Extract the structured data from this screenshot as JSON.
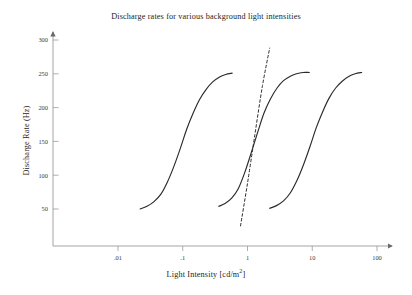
{
  "chart_data": {
    "type": "line",
    "title": "Discharge rates for various background light intensities",
    "xlabel": "Light Intensity [cd/m",
    "xlabel_sup": "2",
    "xlabel_tail": "]",
    "ylabel": "Discharge Rate (Hz)",
    "xscale": "log",
    "xlim": [
      0.0032,
      180
    ],
    "ylim": [
      0,
      310
    ],
    "xticklabels": [
      ".01",
      ".1",
      "1",
      "10",
      "100"
    ],
    "xtickvalues": [
      0.01,
      0.1,
      1,
      10,
      100
    ],
    "yticklabels": [
      "50",
      "100",
      "150",
      "200",
      "250",
      "300"
    ],
    "ytickvalues": [
      50,
      100,
      150,
      200,
      250,
      300
    ],
    "grid": false,
    "legend": "none",
    "series": [
      {
        "name": "curve-1",
        "x": [
          0.022,
          0.028,
          0.036,
          0.046,
          0.058,
          0.073,
          0.092,
          0.115,
          0.145,
          0.182,
          0.23,
          0.29,
          0.365,
          0.46,
          0.58
        ],
        "values": [
          50,
          54,
          61,
          72,
          90,
          113,
          140,
          168,
          192,
          212,
          227,
          238,
          245,
          249,
          251
        ]
      },
      {
        "name": "curve-2",
        "x": [
          0.36,
          0.45,
          0.57,
          0.72,
          0.9,
          1.14,
          1.43,
          1.8,
          2.27,
          2.86,
          3.6,
          4.5,
          5.7,
          7.2,
          9.0
        ],
        "values": [
          54,
          58,
          66,
          80,
          103,
          133,
          163,
          192,
          213,
          229,
          240,
          246,
          250,
          252,
          252
        ]
      },
      {
        "name": "curve-3",
        "x": [
          2.2,
          2.8,
          3.6,
          4.6,
          5.8,
          7.3,
          9.2,
          11.5,
          14.5,
          18.2,
          23,
          29,
          36.5,
          46,
          58
        ],
        "values": [
          51,
          55,
          62,
          74,
          92,
          115,
          142,
          170,
          194,
          214,
          229,
          239,
          246,
          250,
          252
        ]
      },
      {
        "name": "tangent-dashed-line",
        "style": "dashed",
        "x": [
          0.78,
          1.0,
          1.3,
          1.7,
          2.2
        ],
        "values": [
          25,
          88,
          160,
          232,
          288
        ]
      }
    ]
  },
  "axes": {
    "origin_x": 53,
    "origin_y": 246,
    "x_decade_px": 64.75,
    "x_at_001_px": 118,
    "y_at_50_px": 209,
    "y_per_50hz_px": 33.8,
    "x_arrow_tip_px": 396,
    "y_arrow_tip_px": 28
  }
}
